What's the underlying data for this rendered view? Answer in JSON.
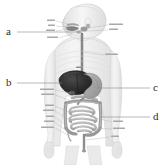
{
  "diagram": {
    "background_color": "#ffffff",
    "ink_color": "#9a9a9a",
    "leader_color": "#8c8c8c",
    "label_color": "#2b2b2b",
    "organ_label_color": "#a6a6a6",
    "liver_color": "#2e2e2e",
    "body_fill": "#ededed",
    "caption": ""
  },
  "question_labels": [
    {
      "id": "a",
      "letter": "a",
      "side": "left",
      "points_to": "mouth / salivary glands"
    },
    {
      "id": "b",
      "letter": "b",
      "side": "left",
      "points_to": "liver"
    },
    {
      "id": "c",
      "letter": "c",
      "side": "right",
      "points_to": "stomach"
    },
    {
      "id": "d",
      "letter": "d",
      "side": "right",
      "points_to": "small intestine"
    }
  ],
  "organ_labels_left": [
    {
      "text": "mouth"
    },
    {
      "text": "teeth"
    },
    {
      "text": "tongue"
    },
    {
      "text": "epiglottis"
    },
    {
      "text": "gallbladder"
    },
    {
      "text": "duodenum"
    },
    {
      "text": "ileum"
    },
    {
      "text": "cecum"
    },
    {
      "text": "colon"
    },
    {
      "text": "appendix"
    },
    {
      "text": "rectum"
    }
  ],
  "organ_labels_right": [
    {
      "text": "salivary glands"
    },
    {
      "text": "pharynx"
    },
    {
      "text": "esophagus"
    },
    {
      "text": "liver"
    },
    {
      "text": "stomach"
    },
    {
      "text": "pancreas"
    },
    {
      "text": "jejunum"
    },
    {
      "text": "anus"
    }
  ]
}
